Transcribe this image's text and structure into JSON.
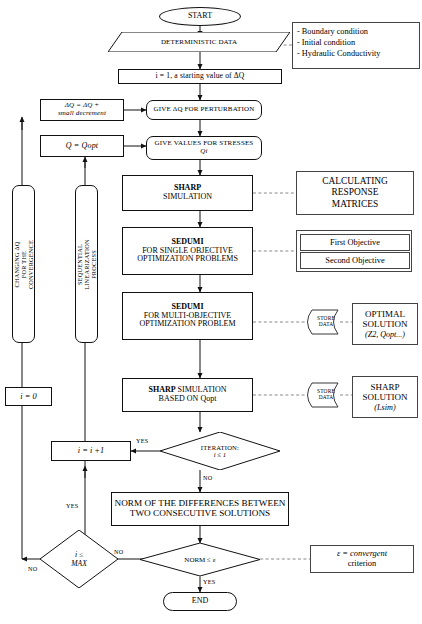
{
  "diagram": {
    "nodes": {
      "start": "START",
      "deterministic_data": "DETERMINISTIC DATA",
      "init": "i = 1, a starting value of ΔQ",
      "give_dq": "GIVE ΔQ FOR PERTURBATION",
      "give_stresses_line1": "GIVE VALUES FOR STRESSES",
      "give_stresses_line2": "Qi",
      "sharp_sim_line1": "SHARP",
      "sharp_sim_line2": "SIMULATION",
      "sedumi_single_line1": "SEDUMI",
      "sedumi_single_line2": "FOR SINGLE OBJECTIVE",
      "sedumi_single_line3": "OPTIMIZATION PROBLEMS",
      "sedumi_multi_line1": "SEDUMI",
      "sedumi_multi_line2": "FOR MULTI-OBJECTIVE",
      "sedumi_multi_line3": "OPTIMIZATION PROBLEM",
      "sharp_opt_line1a": "SHARP",
      "sharp_opt_line1b": " SIMULATION",
      "sharp_opt_line2": "BASED ON Qopt",
      "iteration_line1": "ITERATION:",
      "iteration_line2": "i ≤ 1",
      "norm_line1": "NORM OF THE DIFFERENCES BETWEEN",
      "norm_line2": "TWO CONSECUTIVE SOLUTIONS",
      "norm_test": "NORM ≤ ε",
      "end": "END",
      "i_increment": "i = i +1",
      "i_zero": "i = 0",
      "i_max_line1": "i ≤",
      "i_max_line2": "MAX",
      "dq_update_line1": "ΔQ = ΔQ +",
      "dq_update_line2": "small decrement",
      "q_opt": "Q = Qopt"
    },
    "side_panels": {
      "conditions": [
        "- Boundary condition",
        "- Initial condition",
        "- Hydraulic Conductivity"
      ],
      "calculating_response": [
        "CALCULATING",
        "RESPONSE",
        "MATRICES"
      ],
      "objectives": [
        "First Objective",
        "Second Objective"
      ],
      "optimal_solution": [
        "OPTIMAL",
        "SOLUTION",
        "(Z2, Qopt...)"
      ],
      "sharp_solution": [
        "SHARP",
        "SOLUTION",
        "(Lsim)"
      ],
      "epsilon_note_line1": "ε = convergent",
      "epsilon_note_line2": "criterion"
    },
    "store_data_label": [
      "STORE",
      "DATA"
    ],
    "vertical_labels": {
      "changing_dq": "CHANGING ΔQ FOR THE CONVERGENCE",
      "sequential": "SEQUENTIAL   LINEARIZATION PROCESS"
    },
    "edge_labels": {
      "iteration_yes": "YES",
      "iteration_no": "NO",
      "norm_yes": "YES",
      "norm_no": "NO",
      "max_no": "NO",
      "max_yes": "YES"
    },
    "colors": {
      "line": "#111111",
      "dashed": "#777777",
      "background": "#ffffff"
    }
  }
}
